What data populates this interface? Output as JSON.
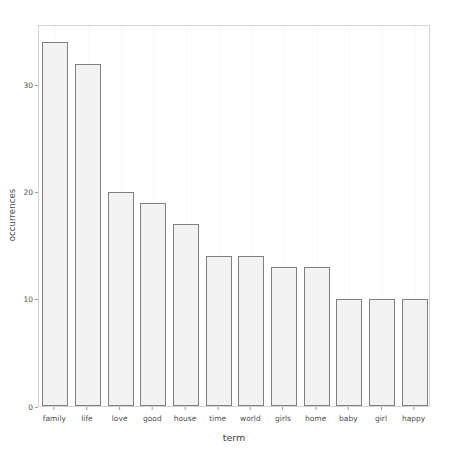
{
  "chart_data": {
    "type": "bar",
    "title": "",
    "xlabel": "term",
    "ylabel": "occurrences",
    "categories": [
      "family",
      "life",
      "love",
      "good",
      "house",
      "time",
      "world",
      "girls",
      "home",
      "baby",
      "girl",
      "happy"
    ],
    "values": [
      34,
      32,
      20,
      19,
      17,
      14,
      14,
      13,
      13,
      10,
      10,
      10
    ],
    "ylim": [
      0,
      35.7
    ],
    "xlim": [
      0,
      12
    ],
    "y_ticks": [
      0,
      10,
      20,
      30
    ],
    "y_tick_labels": [
      "0",
      "10",
      "20",
      "30"
    ],
    "grid": "minor-vertical-only",
    "legend": "none",
    "bar_fill": "#f2f2f2",
    "bar_stroke": "#808080",
    "panel_background": "#ffffff",
    "panel_border": "#d4d4d4",
    "axis_text_color": "#4d4d4d"
  }
}
